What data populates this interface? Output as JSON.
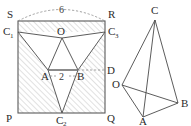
{
  "figure": {
    "caption_text": "",
    "left_diagram": {
      "name": "net-of-tetrahedron-in-rectangle",
      "corner_labels": {
        "top_left": "S",
        "top_right": "R",
        "bottom_left": "P",
        "bottom_right": "Q"
      },
      "point_labels": {
        "left_apex": "C",
        "left_apex_sub": "1",
        "right_apex": "C",
        "right_apex_sub": "3",
        "bottom_apex": "C",
        "bottom_apex_sub": "2",
        "center": "O",
        "inner_left": "A",
        "inner_right": "B",
        "right_edge_point": "D"
      },
      "measurements": {
        "arc_label": "6",
        "segment_label": "2"
      },
      "hatch_color": "#b9b9b9",
      "line_color": "#4a4a4a"
    },
    "right_diagram": {
      "name": "folded-tetrahedron",
      "vertex_labels": {
        "apex": "C",
        "left": "O",
        "bottom": "A",
        "right": "B"
      },
      "line_color": "#4a4a4a"
    }
  }
}
